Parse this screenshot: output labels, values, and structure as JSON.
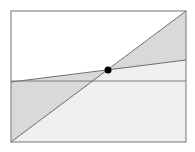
{
  "diagram": {
    "colors": {
      "background": "#ffffff",
      "frame": "#8a8a8a",
      "line": "#6e6e6e",
      "shade_dark": "#d9d9d9",
      "shade_light": "#efefef",
      "point": "#000000"
    },
    "frame": {
      "x1": 11,
      "y1": 11,
      "x2": 186,
      "y2": 142
    },
    "diagonal_line": {
      "x1": 11,
      "y1": 142,
      "x2": 186,
      "y2": 11
    },
    "sloped_line": {
      "x1": 11,
      "y1": 82,
      "x2": 186,
      "y2": 60
    },
    "horizontal_line": {
      "x1": 11,
      "y1": 81,
      "x2": 186,
      "y2": 81
    },
    "intersection_point": {
      "cx": 108,
      "cy": 70,
      "r": 3.5
    }
  }
}
